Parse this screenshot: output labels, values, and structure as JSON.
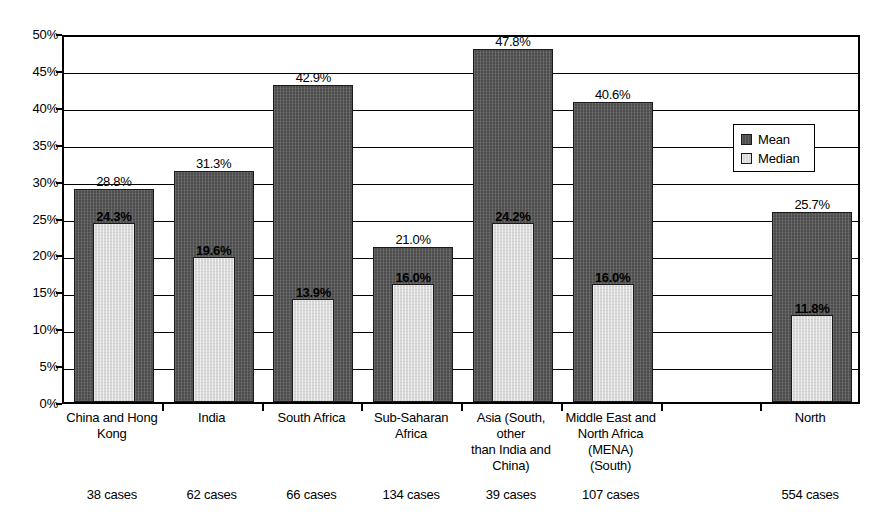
{
  "chart_data": {
    "type": "bar",
    "title": "",
    "subtitle": "",
    "xlabel": "",
    "ylabel": "",
    "ylim": [
      0,
      50
    ],
    "ytick_labels": [
      "50%",
      "45%",
      "40%",
      "35%",
      "30%",
      "25%",
      "20%",
      "15%",
      "10%",
      "5%",
      "0%"
    ],
    "ytick_values": [
      50,
      45,
      40,
      35,
      30,
      25,
      20,
      15,
      10,
      5,
      0
    ],
    "grid": "horizontal",
    "legend_position": "upper-right",
    "bar_style": "overlapped",
    "categories": [
      "China and Hong Kong",
      "India",
      "South Africa",
      "Sub-Saharan Africa",
      "Asia (South, other than India and China)",
      "Middle East and North Africa (MENA) (South)",
      "",
      "North"
    ],
    "category_lines": [
      [
        "China and Hong",
        "Kong"
      ],
      [
        "India"
      ],
      [
        "South Africa"
      ],
      [
        "Sub-Saharan",
        "Africa"
      ],
      [
        "Asia (South,",
        "other",
        "than India and",
        "China)"
      ],
      [
        "Middle East and",
        "North Africa",
        "(MENA)",
        "(South)"
      ],
      [],
      [
        "North"
      ]
    ],
    "series": [
      {
        "name": "Mean",
        "color": "#4d4d4d",
        "values": [
          28.8,
          31.3,
          42.9,
          21.0,
          47.8,
          40.6,
          null,
          25.7
        ],
        "labels": [
          "28.8%",
          "31.3%",
          "42.9%",
          "21.0%",
          "47.8%",
          "40.6%",
          "",
          "25.7%"
        ]
      },
      {
        "name": "Median",
        "color": "#d9d9d9",
        "values": [
          24.3,
          19.6,
          13.9,
          16.0,
          24.2,
          16.0,
          null,
          11.8
        ],
        "labels": [
          "24.3%",
          "19.6%",
          "13.9%",
          "16.0%",
          "24.2%",
          "16.0%",
          "",
          "11.8%"
        ]
      }
    ],
    "case_counts": [
      "38 cases",
      "62 cases",
      "66 cases",
      "134 cases",
      "39 cases",
      "107 cases",
      "",
      "554 cases"
    ]
  },
  "legend": {
    "items": [
      {
        "label": "Mean",
        "swatch": "mean-swatch"
      },
      {
        "label": "Median",
        "swatch": "median-swatch"
      }
    ]
  }
}
